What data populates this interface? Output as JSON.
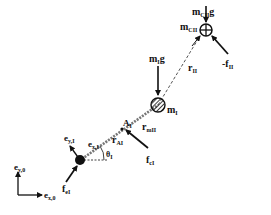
{
  "diagram": {
    "type": "free-body diagram",
    "colors": {
      "ink": "#111111",
      "dashed_rod": "#666666",
      "background": "#ffffff"
    },
    "masses": [
      {
        "id": "end-mass",
        "label": "m",
        "sub": "CII",
        "glyph": "circle-plus"
      },
      {
        "id": "middle-mass",
        "label": "m",
        "sub": "I",
        "glyph": "hatched-circle"
      },
      {
        "id": "base-body",
        "glyph": "filled-circle"
      }
    ],
    "labels": {
      "gravity_end": {
        "main": "m",
        "sub": "CII",
        "tail": "g"
      },
      "mass_end": {
        "main": "m",
        "sub": "CII"
      },
      "gravity_mid": {
        "main": "m",
        "sub": "I",
        "tail": "g"
      },
      "mass_mid": {
        "main": "m",
        "sub": "I"
      },
      "r_II": {
        "main": "r",
        "sub": "II"
      },
      "neg_f_II": {
        "main": "-f",
        "sub": "II"
      },
      "r_mII": {
        "main": "r",
        "sub": "mII"
      },
      "r_AI": {
        "main": "r",
        "sub": "AI"
      },
      "A_I": {
        "main": "A",
        "sub": "I"
      },
      "f_cI": {
        "main": "f",
        "sub": "cI"
      },
      "e_xI": {
        "main": "e",
        "sub": "x,I"
      },
      "e_yI": {
        "main": "e",
        "sub": "y,I"
      },
      "theta_I": {
        "main": "θ",
        "sub": "I"
      },
      "f_eI": {
        "main": "f",
        "sub": "eI"
      },
      "e_y0": {
        "main": "e",
        "sub": "y,0"
      },
      "e_x0": {
        "main": "e",
        "sub": "x,0"
      }
    }
  }
}
